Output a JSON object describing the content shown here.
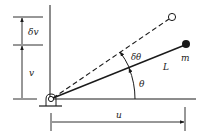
{
  "diagram": {
    "labels": {
      "delta_v": "δv",
      "v": "v",
      "delta_theta": "δθ",
      "L": "L",
      "m": "m",
      "theta": "θ",
      "u": "u"
    },
    "colors": {
      "line": "#1a1a1a",
      "background": "#ffffff"
    }
  }
}
